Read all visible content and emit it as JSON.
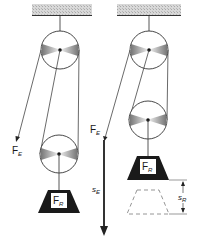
{
  "diagram": {
    "colors": {
      "line": "#3a3a3a",
      "ceiling": "#cfcfcf",
      "weight": "#1a1a1a",
      "label_box": "#ffffff",
      "dashed": "#8a8a8a"
    },
    "left_setup": {
      "effort_label": {
        "main": "F",
        "sub": "E"
      },
      "load_label": {
        "main": "F",
        "sub": "R"
      }
    },
    "right_setup": {
      "effort_label": {
        "main": "F",
        "sub": "E"
      },
      "load_label": {
        "main": "F",
        "sub": "R"
      },
      "effort_distance_label": {
        "main": "s",
        "sub": "E"
      },
      "load_distance_label": {
        "main": "s",
        "sub": "R"
      }
    }
  }
}
